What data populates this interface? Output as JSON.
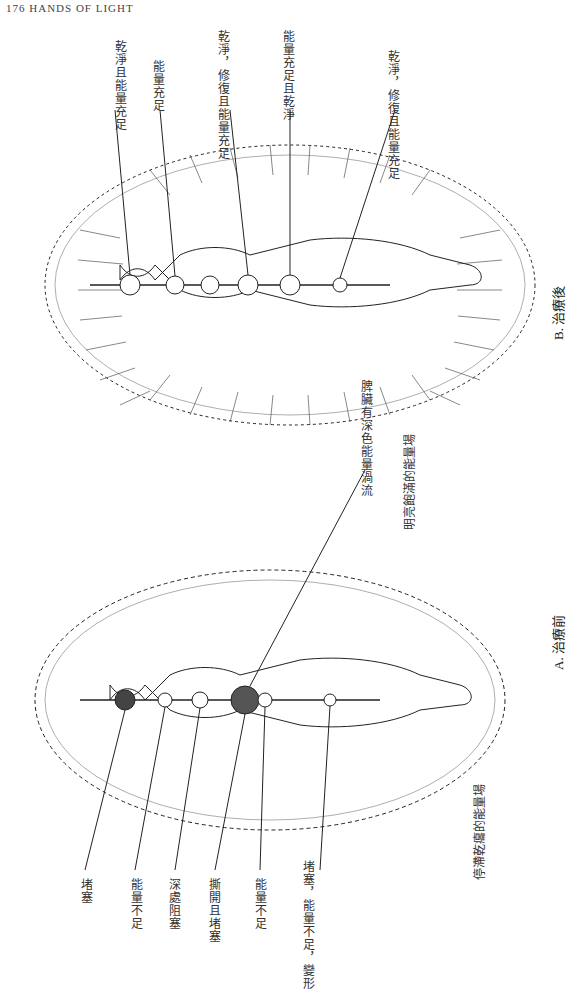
{
  "page": {
    "header": "176    HANDS OF LIGHT"
  },
  "figure_b": {
    "caption": "B. 治療後",
    "field_label": "明亮飽滿的能量場",
    "labels": [
      "乾淨且能量充足",
      "能量充足",
      "乾淨，修復且能量充足",
      "能量充足且乾淨",
      "乾淨，修復且能量充足"
    ]
  },
  "figure_a": {
    "caption": "A. 治療前",
    "field_label": "停滯乾癟的能量場",
    "top_label": "脾臟有深色能量渦流",
    "labels": [
      "堵塞",
      "能量不足",
      "深處阻塞",
      "撕開且堵塞",
      "能量不足",
      "堵塞，能量不足，變形"
    ]
  }
}
